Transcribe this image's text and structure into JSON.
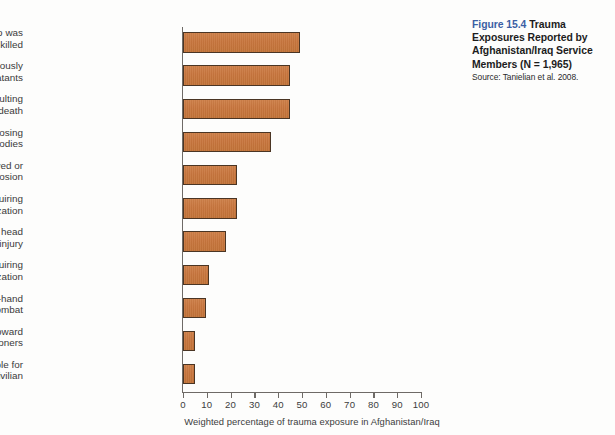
{
  "caption": {
    "figure_number": "Figure 15.4",
    "title": " Trauma Exposures Reported by Afghanistan/Iraq Service Members (N = 1,965)",
    "source": "Source:  Tanielian et al. 2008.",
    "figno_color": "#3b5fa4"
  },
  "style": {
    "bar_fill": "#c8763e",
    "bar_border": "#4a3524",
    "axis_color": "#6e6a66",
    "label_color": "#3a3a3a"
  },
  "chart_data": {
    "type": "bar",
    "orientation": "horizontal",
    "title": "Trauma Exposures Reported by Afghanistan/Iraq Service Members (N = 1,965)",
    "xlabel": "Weighted percentage of trauma exposure in Afghanistan/Iraq",
    "ylabel": "",
    "xlim": [
      0,
      100
    ],
    "xticks": [
      0,
      10,
      20,
      30,
      40,
      50,
      60,
      70,
      80,
      90,
      100
    ],
    "grid": false,
    "legend": false,
    "categories": [
      "Having a friend who was seriously wounded or killed",
      "Seeing dead or seriously injured noncombatants",
      "Witnessing an accident resulting in serious injury or death",
      "Smelling decomposing bodies",
      "Being physically moved or knocked over by an explosion",
      "Being injured, not requiring hospitalization",
      "Having a blow to the head from any accident or injury",
      "Being injured, requiring hospitalization",
      "Engaging in hand-to-hand combat",
      "Witnessing brutality toward detainees/prisoners",
      "Being responsible for the death of a civilian"
    ],
    "category_lines": [
      [
        "Having a friend who was",
        "seriously wounded or killed"
      ],
      [
        "Seeing dead or seriously",
        "injured noncombatants"
      ],
      [
        "Witnessing an accident resulting",
        "in serious injury or death"
      ],
      [
        "Smelling decomposing",
        "bodies"
      ],
      [
        "Being physically moved or",
        "knocked over by an explosion"
      ],
      [
        "Being injured, not requiring",
        "hospitalization"
      ],
      [
        "Having a blow to the head",
        "from any accident or injury"
      ],
      [
        "Being injured, requiring",
        "hospitalization"
      ],
      [
        "Engaging in hand-to-hand",
        "combat"
      ],
      [
        "Witnessing brutality toward",
        "detainees/prisoners"
      ],
      [
        "Being responsible for",
        "the death of a civilian"
      ]
    ],
    "values": [
      49,
      45,
      45,
      37,
      22.5,
      22.5,
      18,
      11,
      9.5,
      5,
      5
    ]
  }
}
